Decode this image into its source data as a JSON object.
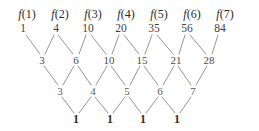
{
  "diagram": {
    "line_color": "#8a8a8a",
    "text_color": "#4a4a4a",
    "background": "#ffffff",
    "function_labels": [
      {
        "text": "f(1)",
        "x": 27,
        "y": 14
      },
      {
        "text": "f(2)",
        "x": 60,
        "y": 14
      },
      {
        "text": "f(3)",
        "x": 93,
        "y": 14
      },
      {
        "text": "f(4)",
        "x": 126,
        "y": 14
      },
      {
        "text": "f(5)",
        "x": 159,
        "y": 14
      },
      {
        "text": "f(6)",
        "x": 192,
        "y": 14
      },
      {
        "text": "f(7)",
        "x": 225,
        "y": 14
      }
    ],
    "rows": [
      {
        "name": "values-row",
        "y": 29,
        "values": [
          {
            "text": "1",
            "x": 23
          },
          {
            "text": "4",
            "x": 56
          },
          {
            "text": "10",
            "x": 88
          },
          {
            "text": "20",
            "x": 121
          },
          {
            "text": "35",
            "x": 154
          },
          {
            "text": "56",
            "x": 187
          },
          {
            "text": "84",
            "x": 220
          }
        ]
      },
      {
        "name": "first-difference-row",
        "y": 60,
        "values": [
          {
            "text": "3",
            "x": 42
          },
          {
            "text": "6",
            "x": 76
          },
          {
            "text": "10",
            "x": 109
          },
          {
            "text": "15",
            "x": 142
          },
          {
            "text": "21",
            "x": 176
          },
          {
            "text": "28",
            "x": 209
          }
        ]
      },
      {
        "name": "second-difference-row",
        "y": 91,
        "values": [
          {
            "text": "3",
            "x": 60
          },
          {
            "text": "4",
            "x": 93
          },
          {
            "text": "5",
            "x": 127
          },
          {
            "text": "6",
            "x": 160
          },
          {
            "text": "7",
            "x": 193
          }
        ]
      },
      {
        "name": "third-difference-row",
        "y": 119,
        "values": [
          {
            "text": "1",
            "x": 76
          },
          {
            "text": "1",
            "x": 110
          },
          {
            "text": "1",
            "x": 143
          },
          {
            "text": "1",
            "x": 177
          }
        ]
      }
    ],
    "edges": [
      {
        "x1": 26,
        "y1": 35,
        "x2": 40,
        "y2": 54
      },
      {
        "x1": 54,
        "y1": 35,
        "x2": 45,
        "y2": 54
      },
      {
        "x1": 58,
        "y1": 35,
        "x2": 73,
        "y2": 54
      },
      {
        "x1": 86,
        "y1": 35,
        "x2": 79,
        "y2": 54
      },
      {
        "x1": 91,
        "y1": 35,
        "x2": 106,
        "y2": 54
      },
      {
        "x1": 119,
        "y1": 35,
        "x2": 112,
        "y2": 54
      },
      {
        "x1": 124,
        "y1": 35,
        "x2": 139,
        "y2": 54
      },
      {
        "x1": 152,
        "y1": 35,
        "x2": 145,
        "y2": 54
      },
      {
        "x1": 157,
        "y1": 35,
        "x2": 173,
        "y2": 54
      },
      {
        "x1": 185,
        "y1": 35,
        "x2": 179,
        "y2": 54
      },
      {
        "x1": 190,
        "y1": 35,
        "x2": 206,
        "y2": 54
      },
      {
        "x1": 218,
        "y1": 35,
        "x2": 212,
        "y2": 54
      },
      {
        "x1": 44,
        "y1": 66,
        "x2": 58,
        "y2": 85
      },
      {
        "x1": 74,
        "y1": 66,
        "x2": 63,
        "y2": 85
      },
      {
        "x1": 78,
        "y1": 66,
        "x2": 91,
        "y2": 85
      },
      {
        "x1": 107,
        "y1": 66,
        "x2": 96,
        "y2": 85
      },
      {
        "x1": 111,
        "y1": 66,
        "x2": 125,
        "y2": 85
      },
      {
        "x1": 140,
        "y1": 66,
        "x2": 130,
        "y2": 85
      },
      {
        "x1": 144,
        "y1": 66,
        "x2": 158,
        "y2": 85
      },
      {
        "x1": 174,
        "y1": 66,
        "x2": 163,
        "y2": 85
      },
      {
        "x1": 178,
        "y1": 66,
        "x2": 191,
        "y2": 85
      },
      {
        "x1": 207,
        "y1": 66,
        "x2": 196,
        "y2": 85
      },
      {
        "x1": 62,
        "y1": 97,
        "x2": 74,
        "y2": 113
      },
      {
        "x1": 91,
        "y1": 97,
        "x2": 79,
        "y2": 113
      },
      {
        "x1": 95,
        "y1": 97,
        "x2": 108,
        "y2": 113
      },
      {
        "x1": 125,
        "y1": 97,
        "x2": 113,
        "y2": 113
      },
      {
        "x1": 129,
        "y1": 97,
        "x2": 141,
        "y2": 113
      },
      {
        "x1": 158,
        "y1": 97,
        "x2": 146,
        "y2": 113
      },
      {
        "x1": 162,
        "y1": 97,
        "x2": 175,
        "y2": 113
      },
      {
        "x1": 191,
        "y1": 97,
        "x2": 180,
        "y2": 113
      }
    ]
  }
}
